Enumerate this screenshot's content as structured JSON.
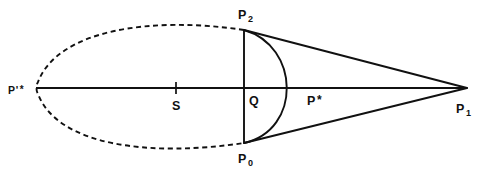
{
  "figure": {
    "background_color": "#ffffff",
    "stroke_color": "#111111",
    "width": 493,
    "height": 181
  },
  "labels": {
    "p_prime_star": {
      "base": "P",
      "prime": "'",
      "star": "*",
      "x": 8,
      "y": 81
    },
    "s": {
      "base": "S",
      "x": 172,
      "y": 97
    },
    "q": {
      "base": "Q",
      "x": 249,
      "y": 92
    },
    "p_star": {
      "base": "P",
      "star": "*",
      "x": 307,
      "y": 92
    },
    "p_two": {
      "base": "P",
      "sub": "2",
      "x": 238,
      "y": 6
    },
    "p_zero": {
      "base": "P",
      "sub": "0",
      "x": 238,
      "y": 150
    },
    "p_one": {
      "base": "P",
      "sub": "1",
      "x": 456,
      "y": 100
    }
  },
  "geometry": {
    "axis": {
      "x1": 36,
      "y1": 88,
      "x2": 467,
      "y2": 88
    },
    "tick_s": {
      "x": 176,
      "y1": 82,
      "y2": 94
    },
    "chord": {
      "x": 244,
      "y1": 30,
      "y2": 143
    },
    "vertex_p1": {
      "x": 467,
      "y": 88
    },
    "point_p2": {
      "x": 244,
      "y": 30
    },
    "point_p0": {
      "x": 244,
      "y": 143
    },
    "point_p_star": {
      "x": 300,
      "y": 88
    },
    "point_p_prime_star": {
      "x": 36,
      "y": 88
    },
    "upper_tangent": "M244,30 L467,88",
    "lower_tangent": "M244,143 L467,88",
    "right_arc": "M244,30 C300,46 302,130 244,143",
    "dashed_oval": "M244,30 C150,16 58,30 38,82 C36,85 36,91 38,94 C58,146 150,157 244,143",
    "dash_pattern": "5,3.6"
  },
  "annotations": {
    "description": "Oval (dashed) with leftmost point P'*, interior point S, vertical chord through Q with endpoints P2 and P0, a solid arc bulging right through P*, and two tangent lines meeting at apex P1."
  }
}
